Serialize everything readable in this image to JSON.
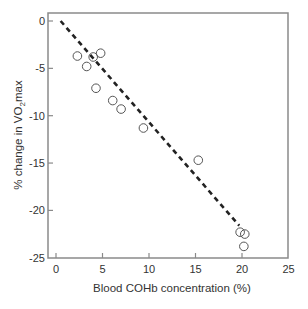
{
  "chart_data": {
    "type": "scatter",
    "title": "",
    "xlabel": "Blood COHb concentration (%)",
    "ylabel": "% change in VO2max",
    "ylabel_parts": {
      "prefix": "% change in VO",
      "subscript": "2",
      "suffix": "max"
    },
    "xlim": [
      -0.8,
      25
    ],
    "ylim": [
      -25,
      0.85
    ],
    "xticks": [
      0,
      5,
      10,
      15,
      20,
      25
    ],
    "yticks": [
      0,
      -5,
      -10,
      -15,
      -20,
      -25
    ],
    "grid": false,
    "legend": null,
    "series": [
      {
        "name": "observations",
        "marker": "open-circle",
        "points": [
          {
            "x": 2.3,
            "y": -3.7
          },
          {
            "x": 3.3,
            "y": -4.8
          },
          {
            "x": 4.0,
            "y": -3.8
          },
          {
            "x": 4.8,
            "y": -3.4
          },
          {
            "x": 4.3,
            "y": -7.1
          },
          {
            "x": 6.1,
            "y": -8.4
          },
          {
            "x": 7.0,
            "y": -9.3
          },
          {
            "x": 9.4,
            "y": -11.3
          },
          {
            "x": 15.3,
            "y": -14.7
          },
          {
            "x": 19.8,
            "y": -22.3
          },
          {
            "x": 20.3,
            "y": -22.5
          },
          {
            "x": 20.2,
            "y": -23.8
          }
        ]
      },
      {
        "name": "regression line",
        "style": "dashed",
        "points": [
          {
            "x": 0.5,
            "y": 0.0
          },
          {
            "x": 19.7,
            "y": -21.6
          }
        ]
      }
    ]
  },
  "colors": {
    "axis": "#8a8a8a",
    "marker_stroke": "#555555",
    "line": "#222222",
    "text": "#333333"
  }
}
